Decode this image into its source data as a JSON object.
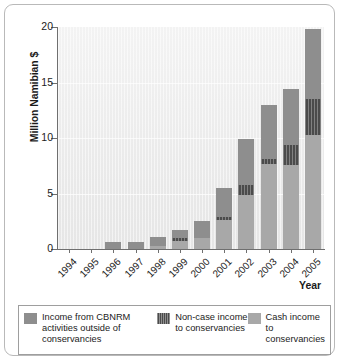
{
  "chart_data": {
    "type": "bar",
    "stacked": true,
    "title": "",
    "xlabel": "Year",
    "ylabel": "Million Namibian $",
    "categories": [
      "1994",
      "1995",
      "1996",
      "1997",
      "1998",
      "1999",
      "2000",
      "2001",
      "2002",
      "2003",
      "2004",
      "2005"
    ],
    "ylim": [
      0,
      20
    ],
    "yticks": [
      0,
      5,
      10,
      15,
      20
    ],
    "ytick_labels": [
      "0",
      "5",
      "10",
      "15",
      "20"
    ],
    "grid": true,
    "legend_position": "bottom",
    "series": [
      {
        "name": "Cash income to conservancies",
        "color": "#a8a8a8",
        "values": [
          0,
          0,
          0,
          0,
          0.3,
          0.75,
          1.0,
          2.6,
          4.9,
          7.7,
          7.6,
          10.3
        ]
      },
      {
        "name": "Non-case income to conservancies",
        "color": "#4b4b4b",
        "values": [
          0,
          0,
          0,
          0,
          0,
          0.2,
          0,
          0.25,
          0.85,
          0.45,
          1.8,
          3.2
        ]
      },
      {
        "name": "Income from CBNRM activities outside of conservancies",
        "color": "#8e8e8e",
        "values": [
          0,
          0,
          0.6,
          0.6,
          0.8,
          0.8,
          1.5,
          2.65,
          4.15,
          4.85,
          5.0,
          6.3
        ]
      }
    ],
    "totals": [
      0,
      0,
      0.6,
      0.6,
      1.1,
      1.75,
      2.5,
      5.5,
      9.9,
      13.0,
      14.4,
      19.8
    ]
  },
  "axis": {
    "y_title": "Million Namibian $",
    "x_title": "Year"
  },
  "legend": {
    "items": [
      {
        "label": "Income from CBNRM activities outside of conservancies",
        "swatch": "cbnrm-swatch",
        "color": "#8e8e8e"
      },
      {
        "label": "Non-case income to conservancies",
        "swatch": "noncash-swatch",
        "color": "#4b4b4b"
      },
      {
        "label": "Cash income to conservancies",
        "swatch": "cash-swatch",
        "color": "#a8a8a8"
      }
    ]
  }
}
